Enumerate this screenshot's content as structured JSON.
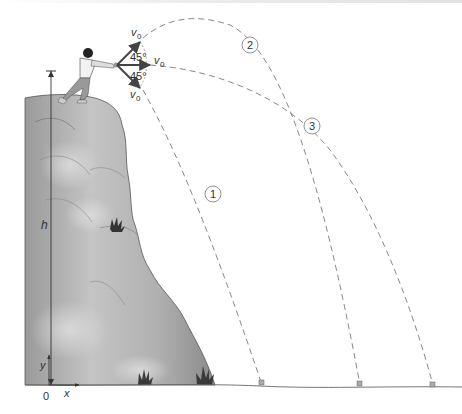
{
  "figure": {
    "type": "projectile-from-cliff diagram",
    "velocity_labels": {
      "upper": "v",
      "upper_sub": "0",
      "middle": "v",
      "middle_sub": "0",
      "lower": "v",
      "lower_sub": "0"
    },
    "angle_labels": {
      "upper": "45°",
      "lower": "45°"
    },
    "trajectory_labels": {
      "one": "1",
      "two": "2",
      "three": "3"
    },
    "axis_labels": {
      "height": "h",
      "y": "y",
      "x": "x",
      "origin": "0"
    },
    "colors": {
      "cliff_light": "#c8c8c8",
      "cliff_dark": "#8e8e8e",
      "trajectory": "#7a7a7a",
      "arrow": "#444444",
      "grass": "#3a3a3a"
    }
  }
}
